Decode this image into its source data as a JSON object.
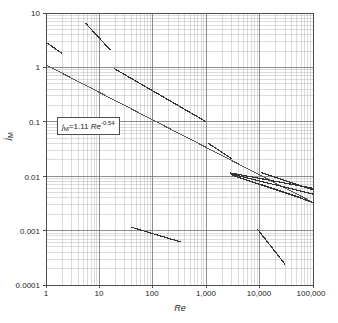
{
  "chart_data": {
    "type": "line",
    "title": "",
    "xlabel": "Re",
    "ylabel": "jM",
    "xscale": "log",
    "yscale": "log",
    "xlim": [
      1,
      100000
    ],
    "ylim": [
      0.0001,
      10
    ],
    "grid": true,
    "grid_minor": true,
    "legend": "none",
    "xticks": [
      1,
      10,
      100,
      1000,
      10000,
      100000
    ],
    "xtick_labels": [
      "1",
      "10",
      "100",
      "1,000",
      "10,000",
      "100,000"
    ],
    "yticks": [
      0.0001,
      0.001,
      0.01,
      0.1,
      1,
      10
    ],
    "ytick_labels": [
      "0.0001",
      "0.001",
      "0.01",
      "0.1",
      "1",
      "10"
    ],
    "annotations": [
      {
        "text": "jM=1.11 Re-0.54",
        "x": 3.0,
        "y": 0.105,
        "boxed": true
      }
    ],
    "series": [
      {
        "name": "correlation-jm-1.11-re-0.54",
        "role": "main-correlation",
        "points": [
          [
            1,
            1.11
          ],
          [
            100000,
            0.0033
          ]
        ],
        "width": 1.0,
        "color": "#555555"
      },
      {
        "name": "segment-a-low-re",
        "points": [
          [
            1,
            2.9
          ],
          [
            2.0,
            1.8
          ]
        ],
        "width": 1.2,
        "color": "#333333"
      },
      {
        "name": "segment-b-steep-upper",
        "points": [
          [
            5.5,
            6.5
          ],
          [
            16,
            2.1
          ]
        ],
        "width": 1.2,
        "color": "#333333"
      },
      {
        "name": "segment-c-mid-long",
        "points": [
          [
            19,
            0.95
          ],
          [
            1000,
            0.1
          ]
        ],
        "width": 1.2,
        "color": "#333333"
      },
      {
        "name": "segment-d-mid-upper",
        "points": [
          [
            1100,
            0.04
          ],
          [
            3000,
            0.021
          ]
        ],
        "width": 1.2,
        "color": "#333333"
      },
      {
        "name": "segment-e-bundle-upper",
        "points": [
          [
            2800,
            0.0115
          ],
          [
            100000,
            0.006
          ]
        ],
        "width": 1.2,
        "color": "#333333"
      },
      {
        "name": "segment-f-bundle-middle",
        "points": [
          [
            2900,
            0.011
          ],
          [
            100000,
            0.0047
          ]
        ],
        "width": 1.2,
        "color": "#333333"
      },
      {
        "name": "segment-g-bundle-lower",
        "points": [
          [
            3000,
            0.0105
          ],
          [
            100000,
            0.0033
          ]
        ],
        "width": 1.2,
        "color": "#333333"
      },
      {
        "name": "segment-h-right-upper-short",
        "points": [
          [
            10500,
            0.0118
          ],
          [
            100000,
            0.0056
          ]
        ],
        "width": 1.2,
        "color": "#333333"
      },
      {
        "name": "segment-i-right-lower-short",
        "points": [
          [
            10000,
            0.0072
          ],
          [
            60000,
            0.004
          ]
        ],
        "width": 1.2,
        "color": "#333333"
      },
      {
        "name": "segment-j-low-left",
        "points": [
          [
            40,
            0.00115
          ],
          [
            330,
            0.00062
          ]
        ],
        "width": 1.2,
        "color": "#333333"
      },
      {
        "name": "segment-k-low-right-steep",
        "points": [
          [
            9000,
            0.00108
          ],
          [
            30000,
            0.00024
          ]
        ],
        "width": 1.2,
        "color": "#333333"
      }
    ],
    "colors": {
      "axis": "#4d4d4d",
      "grid_major": "#707070",
      "grid_minor": "#b8b8b8",
      "data": "#333333",
      "background": "#ffffff"
    }
  },
  "axes": {
    "y": {
      "label_main": "j",
      "label_sub": "M",
      "ticks": [
        "10",
        "1",
        "0.1",
        "0.01",
        "0.001",
        "0.0001"
      ]
    },
    "x": {
      "label": "Re",
      "ticks": [
        "1",
        "10",
        "100",
        "1,000",
        "10,000",
        "100,000"
      ]
    }
  },
  "equation": {
    "lhs_var": "j",
    "lhs_sub": "M",
    "eq": "=1.11 ",
    "re": "Re",
    "exp": "-0.54"
  }
}
